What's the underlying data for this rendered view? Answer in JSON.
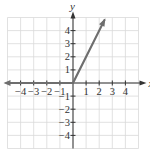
{
  "chart_data": {
    "type": "line",
    "title": "",
    "xlabel": "x",
    "ylabel": "y",
    "xlim": [
      -5,
      5
    ],
    "ylim": [
      -5,
      5
    ],
    "grid": true,
    "x_ticks": [
      -4,
      -3,
      -2,
      -1,
      1,
      2,
      3,
      4
    ],
    "y_ticks": [
      -4,
      -3,
      -2,
      -1,
      1,
      2,
      3,
      4
    ],
    "x_tick_labels": [
      "−4",
      "−3",
      "−2",
      "−1",
      "1",
      "2",
      "3",
      "4"
    ],
    "y_tick_labels": [
      "−4",
      "−3",
      "−2",
      "−1",
      "1",
      "2",
      "3",
      "4"
    ],
    "series": [
      {
        "name": "f(x) = 0 for x < 0",
        "x": [
          -5,
          0
        ],
        "y": [
          0,
          0
        ],
        "arrow_left": true
      },
      {
        "name": "f(x) = 2x for x ≥ 0",
        "x": [
          0,
          2.4
        ],
        "y": [
          0,
          4.8
        ],
        "arrow_end": true
      }
    ],
    "colors": {
      "curve": "#6e6e6e",
      "axes": "#333333",
      "grid": "#d9d9d9"
    }
  }
}
